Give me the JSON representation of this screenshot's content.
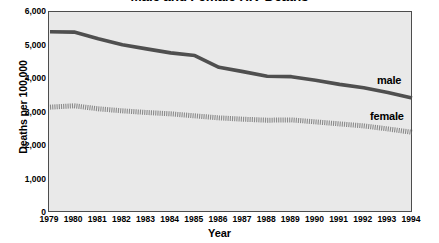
{
  "chart_data": {
    "type": "line",
    "title": "Male and Female HIV Deaths",
    "xlabel": "Year",
    "ylabel": "Deaths per 100,000",
    "x": [
      1979,
      1980,
      1981,
      1982,
      1983,
      1984,
      1985,
      1986,
      1987,
      1988,
      1989,
      1990,
      1991,
      1992,
      1993,
      1994
    ],
    "xticklabels": [
      "1979",
      "1980",
      "1981",
      "1982",
      "1983",
      "1984",
      "1985",
      "1986",
      "1987",
      "1988",
      "1989",
      "1990",
      "1991",
      "1992",
      "1993",
      "1994"
    ],
    "yticks": [
      0,
      1000,
      2000,
      3000,
      4000,
      5000,
      6000
    ],
    "yticklabels": [
      "0",
      "1,000",
      "2,000",
      "3,000",
      "4,000",
      "5,000",
      "6,000"
    ],
    "ylim": [
      0,
      6000
    ],
    "xlim": [
      1979,
      1994
    ],
    "grid": false,
    "legend_position": "inline-right",
    "plot_background": "#e9e9e9",
    "series": [
      {
        "name": "male",
        "label": "male",
        "color": "#4f4f4f",
        "style": "solid",
        "values": [
          5410,
          5400,
          5200,
          5020,
          4900,
          4780,
          4700,
          4350,
          4220,
          4080,
          4070,
          3960,
          3840,
          3740,
          3600,
          3430
        ]
      },
      {
        "name": "female",
        "label": "female",
        "color": "#8a8a8a",
        "style": "dotted",
        "values": [
          3160,
          3200,
          3110,
          3050,
          3000,
          2960,
          2900,
          2840,
          2800,
          2770,
          2780,
          2720,
          2660,
          2600,
          2510,
          2410
        ]
      }
    ]
  },
  "axes": {
    "y_title": "Deaths per 100,000",
    "x_title": "Year"
  }
}
